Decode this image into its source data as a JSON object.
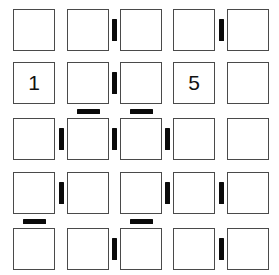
{
  "puzzle": {
    "type": "constraint-grid-puzzle",
    "grid": {
      "rows": 5,
      "columns": 5,
      "cell_size": 42,
      "origin_x": 13,
      "origin_y": 9,
      "col_positions": [
        13,
        67,
        120,
        173,
        227
      ],
      "row_positions": [
        9,
        62,
        118,
        172,
        228
      ],
      "border_color": "#4a4a4a",
      "cell_background": "#ffffff"
    },
    "cells": [
      [
        {
          "id": "r1c1",
          "value": ""
        },
        {
          "id": "r1c2",
          "value": ""
        },
        {
          "id": "r1c3",
          "value": ""
        },
        {
          "id": "r1c4",
          "value": ""
        },
        {
          "id": "r1c5",
          "value": ""
        }
      ],
      [
        {
          "id": "r2c1",
          "value": "1"
        },
        {
          "id": "r2c2",
          "value": ""
        },
        {
          "id": "r2c3",
          "value": ""
        },
        {
          "id": "r2c4",
          "value": "5"
        },
        {
          "id": "r2c5",
          "value": ""
        }
      ],
      [
        {
          "id": "r3c1",
          "value": ""
        },
        {
          "id": "r3c2",
          "value": ""
        },
        {
          "id": "r3c3",
          "value": ""
        },
        {
          "id": "r3c4",
          "value": ""
        },
        {
          "id": "r3c5",
          "value": ""
        }
      ],
      [
        {
          "id": "r4c1",
          "value": ""
        },
        {
          "id": "r4c2",
          "value": ""
        },
        {
          "id": "r4c3",
          "value": ""
        },
        {
          "id": "r4c4",
          "value": ""
        },
        {
          "id": "r4c5",
          "value": ""
        }
      ],
      [
        {
          "id": "r5c1",
          "value": ""
        },
        {
          "id": "r5c2",
          "value": ""
        },
        {
          "id": "r5c3",
          "value": ""
        },
        {
          "id": "r5c4",
          "value": ""
        },
        {
          "id": "r5c5",
          "value": ""
        }
      ]
    ],
    "vertical_bars": [
      {
        "id": "vbar-r1-c2",
        "row": 1,
        "after_col": 2
      },
      {
        "id": "vbar-r1-c4",
        "row": 1,
        "after_col": 4
      },
      {
        "id": "vbar-r2-c2",
        "row": 2,
        "after_col": 2
      },
      {
        "id": "vbar-r3-c1",
        "row": 3,
        "after_col": 1
      },
      {
        "id": "vbar-r3-c2",
        "row": 3,
        "after_col": 2
      },
      {
        "id": "vbar-r3-c3",
        "row": 3,
        "after_col": 3
      },
      {
        "id": "vbar-r4-c1",
        "row": 4,
        "after_col": 1
      },
      {
        "id": "vbar-r4-c3",
        "row": 4,
        "after_col": 3
      },
      {
        "id": "vbar-r4-c4",
        "row": 4,
        "after_col": 4
      },
      {
        "id": "vbar-r5-c2",
        "row": 5,
        "after_col": 2
      },
      {
        "id": "vbar-r5-c4",
        "row": 5,
        "after_col": 4
      }
    ],
    "horizontal_bars": [
      {
        "id": "hbar-r2-c2",
        "below_row": 2,
        "col": 2
      },
      {
        "id": "hbar-r2-c3",
        "below_row": 2,
        "col": 3
      },
      {
        "id": "hbar-r4-c1",
        "below_row": 4,
        "col": 1
      },
      {
        "id": "hbar-r4-c3",
        "below_row": 4,
        "col": 3
      }
    ],
    "bar_style": {
      "color": "#0a0a0a",
      "vertical_width": 5,
      "vertical_height": 22,
      "horizontal_width": 23,
      "horizontal_height": 5
    }
  }
}
